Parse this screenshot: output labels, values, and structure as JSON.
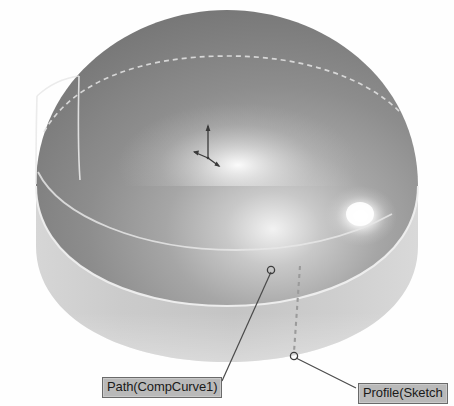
{
  "viewport": {
    "name": "3d-model-viewport",
    "width": 454,
    "height": 406,
    "background_color": "#fefefe"
  },
  "model": {
    "name": "swept-dome-solid",
    "description": "Shaded solid of revolution: hemispherical dome on a cylindrical base",
    "dome_color_dark": "#7c7c7c",
    "dome_color_mid": "#9a9a9a",
    "dome_highlight_color": "#ffffff",
    "cylinder_color": "#c9c9c9",
    "edge_color": "#e8e8e8",
    "dashed_edge_color": "#dcdcdc"
  },
  "origin_marker": {
    "name": "coordinate-triad",
    "color": "#333333",
    "x": 208,
    "y": 150
  },
  "annotations": [
    {
      "id": "path",
      "label": "Path(CompCurve1)",
      "marker_x": 271,
      "marker_y": 270,
      "label_x": 102,
      "label_y": 377,
      "background": "#b9b9b9",
      "border": "#6a6a6a",
      "text_color": "#1a1a1a"
    },
    {
      "id": "profile",
      "label": "Profile(Sketch",
      "marker_x": 294,
      "marker_y": 356,
      "label_x": 358,
      "label_y": 383,
      "background": "#b9b9b9",
      "border": "#6a6a6a",
      "text_color": "#1a1a1a"
    }
  ],
  "guide_line": {
    "name": "profile-dashed-guide",
    "color": "#9b9b9b",
    "x1": 300,
    "y1": 266,
    "x2": 294,
    "y2": 352
  }
}
